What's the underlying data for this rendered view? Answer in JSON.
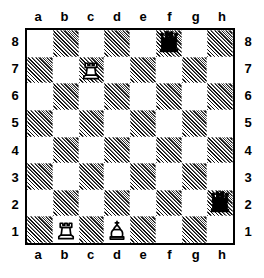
{
  "diagram": {
    "kind": "chess-board-diagram",
    "files_top": [
      "a",
      "b",
      "c",
      "d",
      "e",
      "f",
      "g",
      "h"
    ],
    "files_bottom": [
      "a",
      "b",
      "c",
      "d",
      "e",
      "f",
      "g",
      "h"
    ],
    "ranks_left": [
      "8",
      "7",
      "6",
      "5",
      "4",
      "3",
      "2",
      "1"
    ],
    "ranks_right": [
      "8",
      "7",
      "6",
      "5",
      "4",
      "3",
      "2",
      "1"
    ],
    "colors": {
      "ink": "#000000",
      "light_square": "#ffffff",
      "dark_square_hatch": "#1a1a1a",
      "board_background": "#ffffff"
    },
    "pieces": [
      {
        "square": "f8",
        "color": "black",
        "type": "queen",
        "glyph": "black-queen-icon"
      },
      {
        "square": "c7",
        "color": "white",
        "type": "rook",
        "glyph": "white-rook-icon"
      },
      {
        "square": "h2",
        "color": "black",
        "type": "queen",
        "glyph": "black-queen-icon"
      },
      {
        "square": "b1",
        "color": "white",
        "type": "rook",
        "glyph": "white-rook-icon"
      },
      {
        "square": "d1",
        "color": "white",
        "type": "king",
        "glyph": "white-king-icon"
      }
    ],
    "dark_squares": [
      "b8",
      "d8",
      "f8",
      "h8",
      "a7",
      "c7",
      "e7",
      "g7",
      "b6",
      "d6",
      "f6",
      "h6",
      "a5",
      "c5",
      "e5",
      "g5",
      "b4",
      "d4",
      "f4",
      "h4",
      "a3",
      "c3",
      "e3",
      "g3",
      "b2",
      "d2",
      "f2",
      "h2",
      "a1",
      "c1",
      "e1",
      "g1"
    ]
  }
}
